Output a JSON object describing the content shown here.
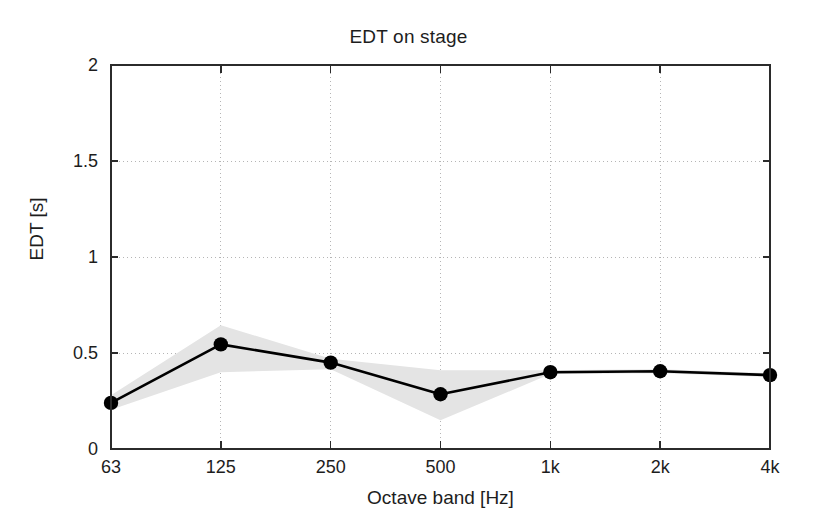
{
  "chart_data": {
    "type": "line",
    "title": "EDT on stage",
    "xlabel": "Octave band [Hz]",
    "ylabel": "EDT [s]",
    "categories": [
      "63",
      "125",
      "250",
      "500",
      "1k",
      "2k",
      "4k"
    ],
    "x_tick_labels": [
      "63",
      "125",
      "250",
      "500",
      "1k",
      "2k",
      "4k"
    ],
    "y_tick_labels": [
      "0",
      "0.5",
      "1",
      "1.5",
      "2"
    ],
    "y_ticks": [
      0,
      0.5,
      1,
      1.5,
      2
    ],
    "ylim": [
      0,
      2
    ],
    "grid": "dotted-both-axes",
    "legend": "none",
    "series": [
      {
        "name": "EDT mean",
        "marker": "filled-circle",
        "color": "#000000",
        "values": [
          0.24,
          0.545,
          0.45,
          0.285,
          0.4,
          0.405,
          0.385
        ]
      }
    ],
    "band": {
      "name": "spread",
      "color": "#e4e4e4",
      "upper": [
        0.28,
        0.645,
        0.47,
        0.41,
        0.41,
        0.415,
        0.395
      ],
      "lower": [
        0.205,
        0.4,
        0.415,
        0.15,
        0.39,
        0.395,
        0.375
      ]
    }
  },
  "figure": {
    "background_color": "#ffffff",
    "axis_color": "#2b2b2b",
    "grid_color": "#b5b5b5",
    "band_color": "#e4e4e4",
    "line_color": "#000000"
  }
}
